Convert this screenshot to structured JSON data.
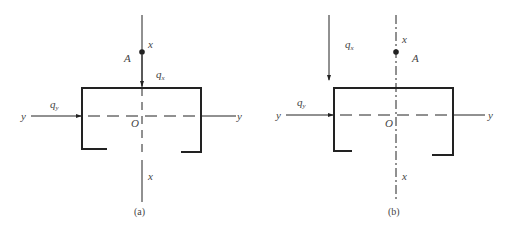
{
  "figures": [
    {
      "id": "a",
      "caption": "(a)",
      "labels": {
        "x_top": "x",
        "x_bottom": "x",
        "y_left": "y",
        "y_right": "y",
        "origin": "O",
        "point": "A",
        "q_x_main": "q",
        "q_x_sub": "x",
        "q_y_main": "q",
        "q_y_sub": "y"
      },
      "x_axis_style": "solid-with-dashed-gap",
      "q_x_position": "on x axis, above section"
    },
    {
      "id": "b",
      "caption": "(b)",
      "labels": {
        "x_top": "x",
        "x_bottom": "x",
        "y_left": "y",
        "y_right": "y",
        "origin": "O",
        "point": "A",
        "q_x_main": "q",
        "q_x_sub": "x",
        "q_y_main": "q",
        "q_y_sub": "y"
      },
      "x_axis_style": "dash-dot",
      "q_x_position": "offset left, at web"
    }
  ],
  "colors": {
    "line": "#222222",
    "text": "#444444"
  }
}
